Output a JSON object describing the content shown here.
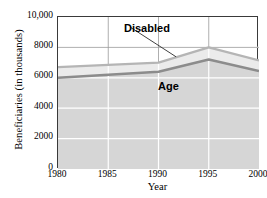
{
  "chart_data": {
    "type": "area",
    "stacked": true,
    "title": "",
    "xlabel": "Year",
    "ylabel": "Beneficiaries (in thousands)",
    "x": [
      1980,
      1985,
      1990,
      1995,
      2000
    ],
    "xtick_labels": [
      "1980",
      "1985",
      "1990",
      "1995",
      "2000"
    ],
    "xlim": [
      1980,
      2000
    ],
    "ylim": [
      0,
      10000
    ],
    "ytick_labels": [
      "0",
      "2000",
      "4000",
      "6000",
      "8000",
      "10,000"
    ],
    "yticks": [
      0,
      2000,
      4000,
      6000,
      8000,
      10000
    ],
    "grid": true,
    "grid_color": "#ffffff",
    "legend": "annotations-on-plot",
    "series": [
      {
        "name": "Age",
        "values": [
          6000,
          6200,
          6400,
          7200,
          6450
        ],
        "fill_color": "#d6d6d6",
        "line_color": "#8c8c8c",
        "label_text": "Age"
      },
      {
        "name": "Disabled",
        "values": [
          700,
          650,
          600,
          800,
          700
        ],
        "cumulative_totals": [
          6700,
          6850,
          7000,
          8000,
          7150
        ],
        "fill_color": "#ebebeb",
        "line_color": "#b5b5b5",
        "label_text": "Disabled"
      }
    ],
    "annotations": [
      {
        "text": "Disabled",
        "points_to_series": "Disabled",
        "has_leader_line": true
      },
      {
        "text": "Age",
        "points_to_series": "Age",
        "has_leader_line": false
      }
    ],
    "axis_color": "#3a3a3a",
    "background": "#ffffff"
  },
  "axes": {
    "y_title": "Beneficiaries (in thousands)",
    "x_title": "Year"
  }
}
